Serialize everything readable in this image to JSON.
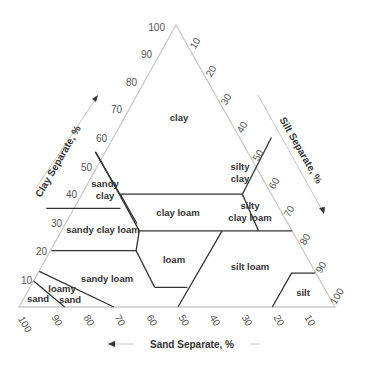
{
  "axes": {
    "clay": {
      "label": "Clay Separate, %",
      "ticks": [
        "10",
        "20",
        "30",
        "40",
        "50",
        "60",
        "70",
        "80",
        "90",
        "100"
      ]
    },
    "silt": {
      "label": "Silt Separate, %",
      "ticks": [
        "10",
        "20",
        "30",
        "40",
        "50",
        "60",
        "70",
        "80",
        "90",
        "100"
      ]
    },
    "sand": {
      "label": "Sand Separate, %",
      "ticks": [
        "100",
        "90",
        "80",
        "70",
        "60",
        "50",
        "40",
        "30",
        "20",
        "10"
      ]
    }
  },
  "classes": [
    {
      "id": "clay",
      "lines": [
        "clay"
      ]
    },
    {
      "id": "sandy-clay",
      "lines": [
        "sandy",
        "clay"
      ]
    },
    {
      "id": "silty-clay",
      "lines": [
        "silty",
        "clay"
      ]
    },
    {
      "id": "clay-loam",
      "lines": [
        "clay loam"
      ]
    },
    {
      "id": "silty-clay-loam",
      "lines": [
        "silty",
        "clay loam"
      ]
    },
    {
      "id": "sandy-clay-loam",
      "lines": [
        "sandy clay loam"
      ]
    },
    {
      "id": "loam",
      "lines": [
        "loam"
      ]
    },
    {
      "id": "silt-loam",
      "lines": [
        "silt loam"
      ]
    },
    {
      "id": "sandy-loam",
      "lines": [
        "sandy loam"
      ]
    },
    {
      "id": "loamy-sand",
      "lines": [
        "loamy",
        "sand"
      ]
    },
    {
      "id": "sand",
      "lines": [
        "sand"
      ]
    },
    {
      "id": "silt",
      "lines": [
        "silt"
      ]
    }
  ],
  "colors": {
    "outline": "#c8c8c8",
    "boundary": "#333333",
    "tick": "#555555",
    "label": "#333333"
  }
}
